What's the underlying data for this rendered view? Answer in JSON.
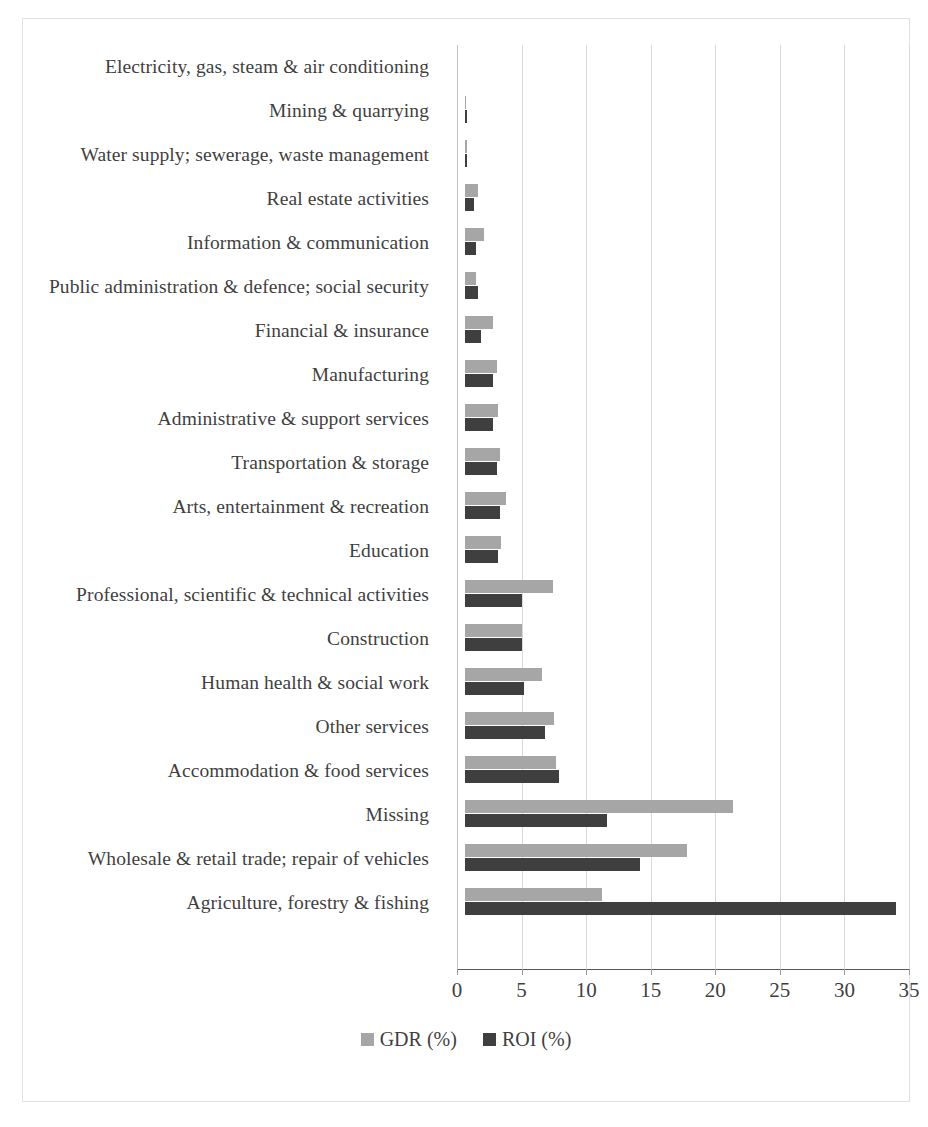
{
  "chart_data": {
    "type": "bar",
    "orientation": "horizontal",
    "title": "",
    "subtitle": "",
    "xlabel": "",
    "ylabel": "",
    "xlim": [
      0,
      35
    ],
    "xticks": [
      0,
      5,
      10,
      15,
      20,
      25,
      30,
      35
    ],
    "grid": "vertical",
    "legend_position": "bottom",
    "categories": [
      "Electricity, gas, steam & air conditioning",
      "Mining & quarrying",
      "Water supply; sewerage, waste management",
      "Real estate activities",
      "Information & communication",
      "Public administration & defence; social security",
      "Financial & insurance",
      "Manufacturing",
      "Administrative & support services",
      "Transportation & storage",
      "Arts, entertainment & recreation",
      "Education",
      "Professional, scientific & technical activities",
      "Construction",
      "Human health & social work",
      "Other services",
      "Accommodation & food services",
      "Missing",
      "Wholesale & retail trade; repair of vehicles",
      "Agriculture, forestry & fishing"
    ],
    "series": [
      {
        "name": "GDR (%)",
        "color": "#a6a6a6",
        "values": [
          0.0,
          0.1,
          0.2,
          1.0,
          1.5,
          0.9,
          2.2,
          2.5,
          2.6,
          2.7,
          3.2,
          2.8,
          6.8,
          4.4,
          6.0,
          6.9,
          7.1,
          20.8,
          17.2,
          10.6
        ]
      },
      {
        "name": "ROI (%)",
        "color": "#3f3f3f",
        "values": [
          0.0,
          0.2,
          0.2,
          0.7,
          0.9,
          1.0,
          1.3,
          2.2,
          2.2,
          2.5,
          2.7,
          2.6,
          4.4,
          4.4,
          4.6,
          6.2,
          7.3,
          11.0,
          13.6,
          33.4
        ]
      }
    ]
  },
  "legend": {
    "items": [
      {
        "label": "GDR (%)",
        "color": "#a6a6a6"
      },
      {
        "label": "ROI (%)",
        "color": "#3f3f3f"
      }
    ]
  }
}
